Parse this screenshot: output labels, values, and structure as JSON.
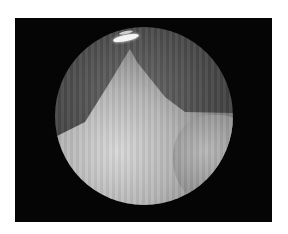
{
  "image": {
    "description": "Grayscale endoscopic view inside a circular field of view on a black background",
    "colors": {
      "background": "#ffffff",
      "frame": "#050505",
      "tissue_light": "#d8d8d8",
      "tissue_dark": "#4a4a4a",
      "glare": "#f4f4f4"
    }
  }
}
